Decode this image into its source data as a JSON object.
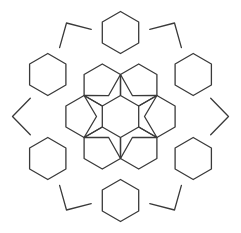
{
  "figure": {
    "title": "",
    "line_color": "#3a3a3a",
    "background_color": "#ffffff",
    "motifs": {
      "inner_ring_hexagons": 6,
      "outer_ring_hexagons": 6,
      "central_star_points": 6
    }
  }
}
